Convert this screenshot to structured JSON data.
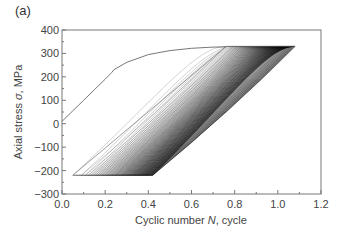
{
  "panel_label": "(a)",
  "chart_data": {
    "type": "line",
    "title": "",
    "xlabel": "Cyclic number N, cycle",
    "xlabel_parts": {
      "pre": "Cyclic number ",
      "var": "N",
      "post": ", cycle"
    },
    "ylabel": "Axial stress σ, MPa",
    "ylabel_parts": {
      "pre": "Axial stress ",
      "var": "σ",
      "post": ", MPa"
    },
    "xlim": [
      0.0,
      1.2
    ],
    "ylim": [
      -300,
      400
    ],
    "xticks": [
      "0.0",
      "0.2",
      "0.4",
      "0.6",
      "0.8",
      "1.0",
      "1.2"
    ],
    "yticks": [
      "400",
      "300",
      "200",
      "100",
      "0",
      "−100",
      "−200",
      "−300"
    ],
    "grid": false,
    "legend": null,
    "series": [
      {
        "name": "initial loading",
        "x": [
          0.0,
          0.05,
          0.1,
          0.15,
          0.2,
          0.23,
          0.24,
          0.3,
          0.4,
          0.5,
          0.6,
          0.7,
          0.76
        ],
        "y": [
          10,
          55,
          100,
          145,
          190,
          218,
          230,
          262,
          295,
          312,
          322,
          327,
          328
        ]
      },
      {
        "name": "cyclic loops (ratcheting)",
        "description": "Many hysteresis loops between σmax ≈ 330 MPa and σmin ≈ −220 MPa, shifting right with increasing N; loop lower-left tips range from N≈0.05 to N≈0.42, upper-right tips range from N≈0.76 to N≈1.08",
        "max_stress": 330,
        "min_stress": -220,
        "first_loop": {
          "min_x": 0.05,
          "max_x": 0.76
        },
        "last_loop": {
          "min_x": 0.42,
          "max_x": 1.08
        },
        "loop_count_approx": 60
      }
    ]
  }
}
